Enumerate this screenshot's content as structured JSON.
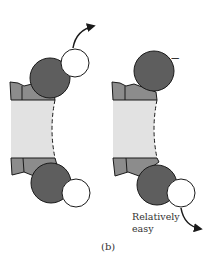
{
  "figure": {
    "panel_label": "(b)",
    "annotation": {
      "line1": "Relatively",
      "line2": "easy"
    },
    "charge_label": "−",
    "colors": {
      "dark_group": "#5e5e5e",
      "mid_group": "#8c8c8c",
      "body": "#e2e2e2",
      "white_group": "#ffffff",
      "outline": "#1a1a1a"
    },
    "molecules": [
      {
        "name": "left-molecule",
        "top_white_group": true,
        "bottom_white_group": true,
        "arrow": "top"
      },
      {
        "name": "right-molecule",
        "top_white_group": false,
        "bottom_white_group": true,
        "arrow": "bottom",
        "charged_top": true
      }
    ]
  }
}
